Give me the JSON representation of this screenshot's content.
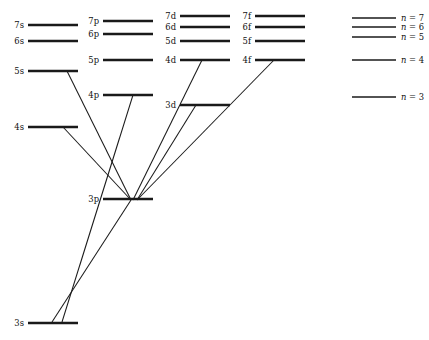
{
  "figure": {
    "width": 429,
    "height": 340,
    "background_color": "#ffffff",
    "line_color": "#1a1a1a"
  },
  "chart_data": {
    "type": "diagram",
    "subtype": "energy-level-grotrian",
    "title": "",
    "xlabel": "",
    "ylabel": "",
    "grid": false,
    "legend_position": "right",
    "columns": [
      {
        "name": "s",
        "label": "s",
        "x_start": 28,
        "x_end": 78
      },
      {
        "name": "p",
        "label": "p",
        "x_start": 103,
        "x_end": 153
      },
      {
        "name": "d",
        "label": "d",
        "x_start": 180,
        "x_end": 230
      },
      {
        "name": "f",
        "label": "f",
        "x_start": 255,
        "x_end": 305
      }
    ],
    "levels": [
      {
        "id": "7s",
        "label": "7s",
        "column": "s",
        "n": 7,
        "x1": 28,
        "x2": 78,
        "y": 25
      },
      {
        "id": "6s",
        "label": "6s",
        "column": "s",
        "n": 6,
        "x1": 28,
        "x2": 78,
        "y": 41
      },
      {
        "id": "5s",
        "label": "5s",
        "column": "s",
        "n": 5,
        "x1": 28,
        "x2": 78,
        "y": 71
      },
      {
        "id": "4s",
        "label": "4s",
        "column": "s",
        "n": 4,
        "x1": 28,
        "x2": 78,
        "y": 127
      },
      {
        "id": "3s",
        "label": "3s",
        "column": "s",
        "n": 3,
        "x1": 28,
        "x2": 78,
        "y": 323
      },
      {
        "id": "7p",
        "label": "7p",
        "column": "p",
        "n": 7,
        "x1": 103,
        "x2": 153,
        "y": 21
      },
      {
        "id": "6p",
        "label": "6p",
        "column": "p",
        "n": 6,
        "x1": 103,
        "x2": 153,
        "y": 34
      },
      {
        "id": "5p",
        "label": "5p",
        "column": "p",
        "n": 5,
        "x1": 103,
        "x2": 153,
        "y": 60
      },
      {
        "id": "4p",
        "label": "4p",
        "column": "p",
        "n": 4,
        "x1": 103,
        "x2": 153,
        "y": 95
      },
      {
        "id": "3p",
        "label": "3p",
        "column": "p",
        "n": 3,
        "x1": 103,
        "x2": 153,
        "y": 199
      },
      {
        "id": "7d",
        "label": "7d",
        "column": "d",
        "n": 7,
        "x1": 180,
        "x2": 230,
        "y": 16
      },
      {
        "id": "6d",
        "label": "6d",
        "column": "d",
        "n": 6,
        "x1": 180,
        "x2": 230,
        "y": 27
      },
      {
        "id": "5d",
        "label": "5d",
        "column": "d",
        "n": 5,
        "x1": 180,
        "x2": 230,
        "y": 41
      },
      {
        "id": "4d",
        "label": "4d",
        "column": "d",
        "n": 4,
        "x1": 180,
        "x2": 230,
        "y": 60
      },
      {
        "id": "3d",
        "label": "3d",
        "column": "d",
        "n": 3,
        "x1": 180,
        "x2": 230,
        "y": 105
      },
      {
        "id": "7f",
        "label": "7f",
        "column": "f",
        "n": 7,
        "x1": 255,
        "x2": 305,
        "y": 16
      },
      {
        "id": "6f",
        "label": "6f",
        "column": "f",
        "n": 6,
        "x1": 255,
        "x2": 305,
        "y": 27
      },
      {
        "id": "5f",
        "label": "5f",
        "column": "f",
        "n": 5,
        "x1": 255,
        "x2": 305,
        "y": 41
      },
      {
        "id": "4f",
        "label": "4f",
        "column": "f",
        "n": 4,
        "x1": 255,
        "x2": 305,
        "y": 60
      }
    ],
    "transitions": [
      {
        "id": "t-5s-3p",
        "from": "5s",
        "to": "3p",
        "x1": 67,
        "y1": 71,
        "x2": 131,
        "y2": 200
      },
      {
        "id": "t-4s-3p",
        "from": "4s",
        "to": "3p",
        "x1": 63,
        "y1": 127,
        "x2": 131,
        "y2": 200
      },
      {
        "id": "t-4p-3s",
        "from": "4p",
        "to": "3s",
        "x1": 133,
        "y1": 95,
        "x2": 62,
        "y2": 322
      },
      {
        "id": "t-3p-3s",
        "from": "3p",
        "to": "3s",
        "x1": 131,
        "y1": 200,
        "x2": 52,
        "y2": 322
      },
      {
        "id": "t-4d-3p",
        "from": "4d",
        "to": "3p",
        "x1": 202,
        "y1": 60,
        "x2": 133,
        "y2": 200
      },
      {
        "id": "t-4f-3p",
        "from": "4f",
        "to": "3p",
        "x1": 274,
        "y1": 60,
        "x2": 137,
        "y2": 200
      },
      {
        "id": "t-3d-3p",
        "from": "3d",
        "to": "3p",
        "x1": 196,
        "y1": 105,
        "x2": 137,
        "y2": 200
      }
    ],
    "legend": {
      "entries": [
        {
          "id": "legend-n7",
          "text": "n = 7",
          "symbol": "n",
          "equals": "=",
          "value": "7",
          "n": 7,
          "y": 18,
          "x1": 352,
          "x2": 396
        },
        {
          "id": "legend-n6",
          "text": "n = 6",
          "symbol": "n",
          "equals": "=",
          "value": "6",
          "n": 6,
          "y": 27,
          "x1": 352,
          "x2": 396
        },
        {
          "id": "legend-n5",
          "text": "n = 5",
          "symbol": "n",
          "equals": "=",
          "value": "5",
          "n": 5,
          "y": 37,
          "x1": 352,
          "x2": 396
        },
        {
          "id": "legend-n4",
          "text": "n = 4",
          "symbol": "n",
          "equals": "=",
          "value": "4",
          "n": 4,
          "y": 60,
          "x1": 352,
          "x2": 396
        },
        {
          "id": "legend-n3",
          "text": "n = 3",
          "symbol": "n",
          "equals": "=",
          "value": "3",
          "n": 3,
          "y": 97,
          "x1": 352,
          "x2": 396
        }
      ]
    }
  }
}
